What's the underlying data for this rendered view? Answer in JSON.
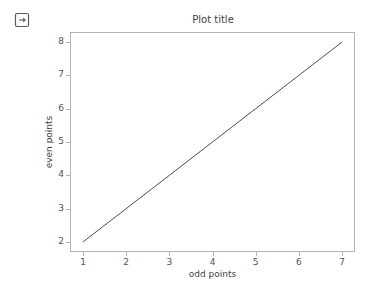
{
  "toolbar": {
    "export_icon": "export-icon"
  },
  "chart_data": {
    "type": "line",
    "title": "Plot title",
    "xlabel": "odd points",
    "ylabel": "even points",
    "x": [
      1,
      2,
      3,
      4,
      5,
      6,
      7
    ],
    "values": [
      2,
      3,
      4,
      5,
      6,
      7,
      8
    ],
    "series": [
      {
        "name": "line",
        "x": [
          1,
          2,
          3,
          4,
          5,
          6,
          7
        ],
        "values": [
          2,
          3,
          4,
          5,
          6,
          7,
          8
        ],
        "color": "#4d4d4d"
      }
    ],
    "xlim": [
      0.7,
      7.3
    ],
    "ylim": [
      1.7,
      8.3
    ],
    "xticks": [
      1,
      2,
      3,
      4,
      5,
      6,
      7
    ],
    "yticks": [
      2,
      3,
      4,
      5,
      6,
      7,
      8
    ],
    "xticklabels": [
      "1",
      "2",
      "3",
      "4",
      "5",
      "6",
      "7"
    ],
    "yticklabels": [
      "2",
      "3",
      "4",
      "5",
      "6",
      "7",
      "8"
    ],
    "grid": false,
    "legend": null,
    "line_color": "#4d4d4d",
    "frame_color": "#b4b4b4",
    "background": "#ffffff"
  }
}
